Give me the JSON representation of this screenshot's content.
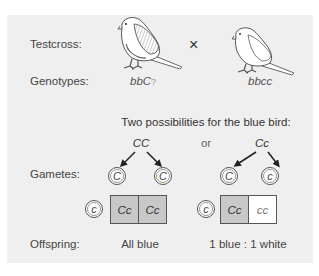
{
  "labels": {
    "testcross": "Testcross:",
    "genotypes": "Genotypes:",
    "gametes": "Gametes:",
    "offspring": "Offspring:"
  },
  "cross_symbol": "×",
  "parents": [
    {
      "name": "blue-bird",
      "genotype": "bbC?",
      "genotype_display": "bbC",
      "unknown_allele": "?",
      "shading": "hatched-blue"
    },
    {
      "name": "white-bird",
      "genotype": "bbcc",
      "shading": "white"
    }
  ],
  "possibilities_heading": "Two possibilities for the blue bird:",
  "or_label": "or",
  "cases": [
    {
      "parent_genotype": "CC",
      "gametes": [
        "C",
        "C"
      ],
      "tester_gamete": "c",
      "offspring_cells": [
        {
          "genotype": "Cc",
          "phenotype": "blue"
        },
        {
          "genotype": "Cc",
          "phenotype": "blue"
        }
      ],
      "result": "All blue"
    },
    {
      "parent_genotype": "Cc",
      "gametes": [
        "C",
        "c"
      ],
      "tester_gamete": "c",
      "offspring_cells": [
        {
          "genotype": "Cc",
          "phenotype": "blue"
        },
        {
          "genotype": "cc",
          "phenotype": "white"
        }
      ],
      "result": "1 blue : 1 white"
    }
  ],
  "colors": {
    "panel_bg": "#efefef",
    "blue_cell": "#c8c8c8",
    "white_cell": "#ffffff",
    "line": "#555555"
  }
}
